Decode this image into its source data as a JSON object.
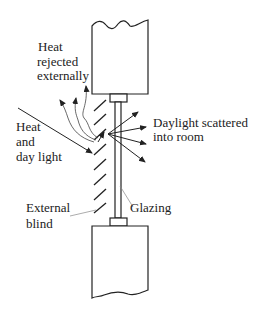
{
  "diagram": {
    "labels": {
      "heat_rejected": [
        "Heat",
        "rejected",
        "externally"
      ],
      "heat_daylight": [
        "Heat",
        "and",
        "day light"
      ],
      "daylight_scattered": [
        "Daylight scattered",
        "into room"
      ],
      "glazing": "Glazing",
      "external_blind": [
        "External",
        "blind"
      ]
    },
    "colors": {
      "line": "#222222",
      "leader": "#888888",
      "background": "#ffffff"
    }
  }
}
